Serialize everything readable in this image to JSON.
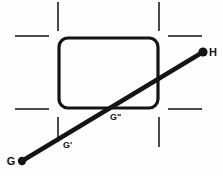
{
  "figure": {
    "background_color": "#fefefe",
    "stroke_color": "#141414",
    "tick_color": "#4a4a4a",
    "width": 223,
    "height": 176
  },
  "labels": {
    "g": "G",
    "g_prime": "G'",
    "g_double_prime": "G\"",
    "h": "H"
  },
  "chart_data": {
    "type": "diagram",
    "xlabel": "",
    "ylabel": "",
    "xlim": [
      0,
      223
    ],
    "ylim": [
      0,
      176
    ],
    "grid": false,
    "legend": "none",
    "shapes": [
      {
        "name": "rounded-rectangle",
        "kind": "rect",
        "x": 59,
        "y": 38,
        "width": 99,
        "height": 70,
        "rx": 9,
        "stroke": "#141414",
        "stroke_width": 3.2,
        "fill": "none"
      },
      {
        "name": "sight-line-g-to-h",
        "kind": "line",
        "x1": 22,
        "y1": 161,
        "x2": 203,
        "y2": 52,
        "stroke": "#141414",
        "stroke_width": 4.4
      }
    ],
    "points": [
      {
        "name": "G",
        "label": "G",
        "x": 22,
        "y": 161,
        "marker": "filled-circle",
        "radius": 4.2,
        "label_x": 11,
        "label_y": 165,
        "label_anchor": "middle"
      },
      {
        "name": "G-prime",
        "label": "G'",
        "x": 58,
        "y": 139,
        "marker": "none",
        "radius": 0,
        "label_x": 63,
        "label_y": 148,
        "label_anchor": "start"
      },
      {
        "name": "G-double-prime",
        "label": "G\"",
        "x": 113,
        "y": 107,
        "marker": "none",
        "radius": 0,
        "label_x": 110,
        "label_y": 120,
        "label_anchor": "start"
      },
      {
        "name": "H",
        "label": "H",
        "x": 203,
        "y": 52,
        "marker": "filled-circle",
        "radius": 4.6,
        "label_x": 213,
        "label_y": 56,
        "label_anchor": "middle"
      }
    ],
    "registration_ticks": [
      {
        "name": "tick-top-left-vertical",
        "orientation": "vertical",
        "x1": 58,
        "y1": 2,
        "x2": 58,
        "y2": 31
      },
      {
        "name": "tick-top-left-horizontal",
        "orientation": "horizontal",
        "x1": 15,
        "y1": 36,
        "x2": 49,
        "y2": 36
      },
      {
        "name": "tick-top-right-vertical",
        "orientation": "vertical",
        "x1": 159,
        "y1": 2,
        "x2": 159,
        "y2": 31
      },
      {
        "name": "tick-top-right-horizontal",
        "orientation": "horizontal",
        "x1": 168,
        "y1": 36,
        "x2": 202,
        "y2": 36
      },
      {
        "name": "tick-bottom-left-horizontal",
        "orientation": "horizontal",
        "x1": 15,
        "y1": 109,
        "x2": 49,
        "y2": 109
      },
      {
        "name": "tick-bottom-left-vertical",
        "orientation": "vertical",
        "x1": 58,
        "y1": 117,
        "x2": 58,
        "y2": 142
      },
      {
        "name": "tick-bottom-right-horizontal",
        "orientation": "horizontal",
        "x1": 168,
        "y1": 109,
        "x2": 202,
        "y2": 109
      },
      {
        "name": "tick-bottom-right-vertical",
        "orientation": "vertical",
        "x1": 159,
        "y1": 117,
        "x2": 159,
        "y2": 147
      }
    ]
  }
}
